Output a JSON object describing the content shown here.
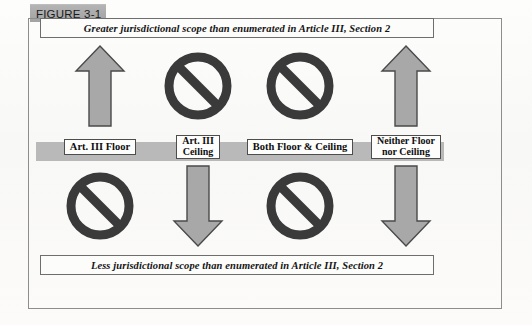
{
  "figure": {
    "tab_label": "FIGURE 3-1"
  },
  "banners": {
    "top": "Greater jurisdictional scope than enumerated in Article III, Section 2",
    "bottom": "Less jurisdictional scope than enumerated in Article III, Section 2"
  },
  "colors": {
    "tab_gray": "#a9a9a9",
    "band_gray": "#b9b9b9",
    "arrow_fill": "#a8a8a8",
    "arrow_stroke": "#4a4a4a",
    "sign_dark": "#3a3a3a",
    "frame_border": "#8d8d8d"
  },
  "columns": [
    {
      "id": "art-iii-floor",
      "top_symbol": "up-arrow-icon",
      "bottom_symbol": "prohibition-icon",
      "label_lines": [
        "Art. III Floor"
      ]
    },
    {
      "id": "art-iii-ceiling",
      "top_symbol": "prohibition-icon",
      "bottom_symbol": "down-arrow-icon",
      "label_lines": [
        "Art.  III",
        "Ceiling"
      ]
    },
    {
      "id": "both-floor-and-ceiling",
      "top_symbol": "prohibition-icon",
      "bottom_symbol": "prohibition-icon",
      "label_lines": [
        "Both Floor & Ceiling"
      ]
    },
    {
      "id": "neither-floor-nor-ceiling",
      "top_symbol": "up-arrow-icon",
      "bottom_symbol": "down-arrow-icon",
      "label_lines": [
        "Neither Floor",
        "nor Ceiling"
      ]
    }
  ]
}
